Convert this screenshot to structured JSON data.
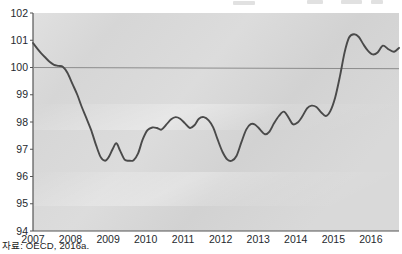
{
  "figure": {
    "source_note": "자료: OECD, 2016a.",
    "top_bleed_fragments": [
      "",
      "",
      "",
      ""
    ]
  },
  "chart_data": {
    "type": "line",
    "title": "",
    "subtitle": "",
    "xlabel": "",
    "ylabel": "",
    "xlim": [
      2007.0,
      2016.75
    ],
    "ylim": [
      94,
      102
    ],
    "yticks": [
      94,
      95,
      96,
      97,
      98,
      99,
      100,
      101,
      102
    ],
    "xticks": [
      2007,
      2008,
      2009,
      2010,
      2011,
      2012,
      2013,
      2014,
      2015,
      2016
    ],
    "xtick_labels": [
      "2007",
      "2008",
      "2009",
      "2010",
      "2011",
      "2012",
      "2013",
      "2014",
      "2015",
      "2016"
    ],
    "ytick_labels": [
      "94",
      "95",
      "96",
      "97",
      "98",
      "99",
      "100",
      "101",
      "102"
    ],
    "grid": false,
    "legend": "none",
    "reference_line": {
      "value": 100,
      "color": "#8c8c8c",
      "label": ""
    },
    "line_color": "#4a4a4a",
    "plot_background": "#d7d7d7",
    "axis_color": "#555555",
    "series": [
      {
        "name": "Composite leading indicator",
        "x": [
          2007.0,
          2007.1,
          2007.22,
          2007.34,
          2007.45,
          2007.56,
          2007.68,
          2007.8,
          2007.92,
          2008.05,
          2008.18,
          2008.3,
          2008.42,
          2008.55,
          2008.68,
          2008.8,
          2008.92,
          2009.02,
          2009.12,
          2009.22,
          2009.32,
          2009.44,
          2009.56,
          2009.68,
          2009.8,
          2009.92,
          2010.05,
          2010.18,
          2010.3,
          2010.42,
          2010.55,
          2010.68,
          2010.8,
          2010.92,
          2011.05,
          2011.18,
          2011.3,
          2011.42,
          2011.55,
          2011.68,
          2011.8,
          2011.92,
          2012.05,
          2012.18,
          2012.3,
          2012.42,
          2012.55,
          2012.68,
          2012.8,
          2012.92,
          2013.05,
          2013.18,
          2013.3,
          2013.42,
          2013.55,
          2013.68,
          2013.8,
          2013.92,
          2014.05,
          2014.18,
          2014.3,
          2014.42,
          2014.55,
          2014.68,
          2014.8,
          2014.92,
          2015.05,
          2015.18,
          2015.3,
          2015.42,
          2015.55,
          2015.68,
          2015.8,
          2015.92,
          2016.05,
          2016.18,
          2016.32,
          2016.48,
          2016.62,
          2016.75
        ],
        "y": [
          100.9,
          100.72,
          100.52,
          100.35,
          100.2,
          100.1,
          100.06,
          100.02,
          99.8,
          99.4,
          99.0,
          98.55,
          98.15,
          97.7,
          97.15,
          96.72,
          96.58,
          96.72,
          97.0,
          97.22,
          96.95,
          96.62,
          96.58,
          96.6,
          96.85,
          97.35,
          97.7,
          97.8,
          97.78,
          97.72,
          97.9,
          98.1,
          98.18,
          98.12,
          97.95,
          97.78,
          97.88,
          98.12,
          98.18,
          98.06,
          97.8,
          97.35,
          96.9,
          96.62,
          96.58,
          96.75,
          97.25,
          97.72,
          97.92,
          97.9,
          97.72,
          97.55,
          97.65,
          97.95,
          98.22,
          98.38,
          98.18,
          97.92,
          97.98,
          98.22,
          98.5,
          98.6,
          98.55,
          98.35,
          98.22,
          98.4,
          98.9,
          99.7,
          100.55,
          101.1,
          101.22,
          101.12,
          100.85,
          100.62,
          100.48,
          100.55,
          100.8,
          100.66,
          100.58,
          100.72
        ]
      }
    ]
  }
}
